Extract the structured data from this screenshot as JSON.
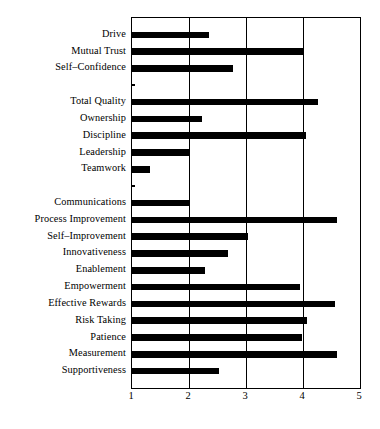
{
  "chart_data": {
    "type": "bar",
    "orientation": "horizontal",
    "title": "",
    "subtitle": "",
    "xlabel": "",
    "ylabel": "",
    "xlim": [
      1,
      5
    ],
    "xticks": [
      "1",
      "2",
      "3",
      "4",
      "5"
    ],
    "xtick_values": [
      1,
      2,
      3,
      4,
      5
    ],
    "grid": true,
    "grid_axis": "x",
    "legend": false,
    "bar_color": "#000000",
    "background_color": "#ffffff",
    "frame_color": "#000000",
    "baseline": 1,
    "categories": [
      "Drive",
      "Mutual Trust",
      "Self–Confidence",
      "",
      "Total Quality",
      "Ownership",
      "Discipline",
      "Leadership",
      "Teamwork",
      "",
      "Communications",
      "Process Improvement",
      "Self–Improvement",
      "Innovativeness",
      "Enablement",
      "Empowerment",
      "Effective Rewards",
      "Risk Taking",
      "Patience",
      "Measurement",
      "Supportiveness"
    ],
    "values": [
      2.35,
      4.0,
      2.78,
      1.03,
      4.27,
      2.22,
      4.05,
      2.0,
      1.32,
      1.03,
      2.0,
      4.6,
      3.03,
      2.68,
      2.28,
      3.95,
      4.57,
      4.07,
      3.98,
      4.6,
      2.53
    ],
    "series": [
      {
        "name": "Rating",
        "values": [
          2.35,
          4.0,
          2.78,
          1.03,
          4.27,
          2.22,
          4.05,
          2.0,
          1.32,
          1.03,
          2.0,
          4.6,
          3.03,
          2.68,
          2.28,
          3.95,
          4.57,
          4.07,
          3.98,
          4.6,
          2.53
        ]
      }
    ]
  }
}
